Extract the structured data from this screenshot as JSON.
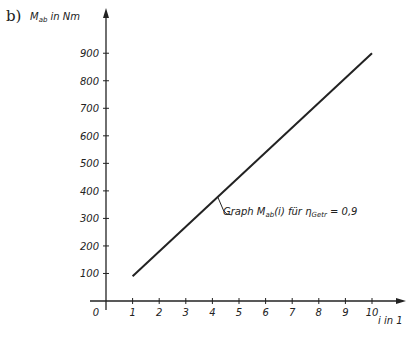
{
  "chart_data": {
    "type": "line",
    "panel_label": "b)",
    "title": "",
    "xlabel": "i in 1",
    "ylabel": "M_ab in Nm",
    "xlim": [
      0,
      10.8
    ],
    "ylim": [
      0,
      950
    ],
    "x_ticks": [
      0,
      1,
      2,
      3,
      4,
      5,
      6,
      7,
      8,
      9,
      10
    ],
    "y_ticks": [
      100,
      200,
      300,
      400,
      500,
      600,
      700,
      800,
      900
    ],
    "grid": false,
    "series": [
      {
        "name": "Graph M_ab(i) für η_Getr = 0,9",
        "x": [
          1,
          10
        ],
        "values": [
          90,
          900
        ]
      }
    ],
    "annotation": {
      "text": "Graph M_ab(i) für η_Getr = 0,9",
      "at_x": 4.2
    }
  },
  "labels": {
    "panel": "b)",
    "ylabel_main": "M",
    "ylabel_sub": "ab",
    "ylabel_unit": " in Nm",
    "xlabel": "i in 1",
    "annot_pre": "Graph M",
    "annot_sub1": "ab",
    "annot_mid": "(i) für η",
    "annot_sub2": "Getr",
    "annot_post": " = 0,9"
  }
}
